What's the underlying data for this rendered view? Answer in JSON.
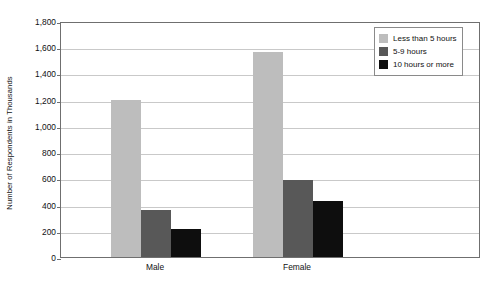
{
  "chart_data": {
    "type": "bar",
    "title": "",
    "xlabel": "",
    "ylabel": "Number of Respondents in Thousands",
    "categories": [
      "Male",
      "Female"
    ],
    "series": [
      {
        "name": "Less than 5 hours",
        "color": "#bdbdbd",
        "values": [
          1200,
          1565
        ]
      },
      {
        "name": "5-9 hours",
        "color": "#585858",
        "values": [
          360,
          585
        ]
      },
      {
        "name": "10 hours or more",
        "color": "#0e0e0e",
        "values": [
          215,
          425
        ]
      }
    ],
    "ylim": [
      0,
      1800
    ],
    "ytick_step": 200,
    "ytick_labels": [
      "1,800",
      "1,600",
      "1,400",
      "1,200",
      "1,000",
      "800",
      "600",
      "400",
      "200",
      "0"
    ],
    "ytick_values": [
      1800,
      1600,
      1400,
      1200,
      1000,
      800,
      600,
      400,
      200,
      0
    ],
    "grid": true,
    "legend_position": "top-right",
    "legend_entries": [
      "Less than 5 hours",
      "5-9 hours",
      "10 hours or more"
    ]
  },
  "axis": {
    "y_title": "Number of Respondents in Thousands"
  },
  "colors": {
    "series_light": "#bdbdbd",
    "series_medium": "#585858",
    "series_dark": "#0e0e0e",
    "gridline": "#c9c9c9",
    "plot_border": "#6f6f6f",
    "legend_border": "#8a8a8a",
    "background": "#ffffff"
  }
}
